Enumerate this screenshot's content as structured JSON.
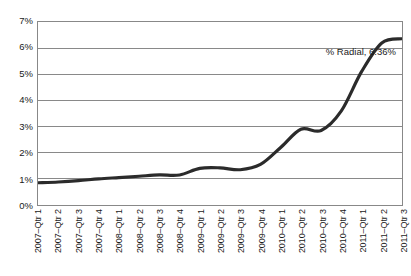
{
  "chart_data": {
    "type": "line",
    "title": "",
    "subtitle": "",
    "xlabel": "",
    "ylabel": "",
    "ylim": [
      0,
      7
    ],
    "ytick_labels": [
      "0%",
      "1%",
      "2%",
      "3%",
      "4%",
      "5%",
      "6%",
      "7%"
    ],
    "ytick_values": [
      0,
      1,
      2,
      3,
      4,
      5,
      6,
      7
    ],
    "grid": true,
    "legend_position": "none",
    "annotation": "% Radial, 6.36%",
    "series_name": "% Radial",
    "final_value_label": "6.36%",
    "line_color": "#2b2b2b",
    "line_color_alt": "#8c8c8c",
    "grid_color": "#888888",
    "categories": [
      "2007–Qtr 1",
      "2007–Qtr 2",
      "2007–Qtr 3",
      "2007–Qtr 4",
      "2008–Qtr 1",
      "2008–Qtr 2",
      "2008–Qtr 3",
      "2008–Qtr 4",
      "2009–Qtr 1",
      "2009–Qtr 2",
      "2009–Qtr 3",
      "2009–Qtr 4",
      "2010–Qtr 1",
      "2010–Qtr 2",
      "2010–Qtr 3",
      "2010–Qtr 4",
      "2011–Qtr 1",
      "2011–Qtr 2",
      "2011–Qtr 3"
    ],
    "series": [
      {
        "name": "% Radial",
        "values": [
          0.85,
          0.88,
          0.93,
          1.0,
          1.05,
          1.1,
          1.15,
          1.15,
          1.4,
          1.42,
          1.35,
          1.55,
          2.2,
          2.9,
          2.85,
          3.6,
          5.1,
          6.2,
          6.36
        ]
      }
    ]
  }
}
